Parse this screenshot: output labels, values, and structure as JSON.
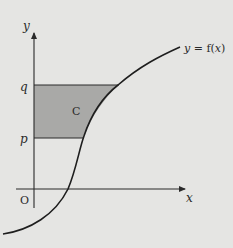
{
  "diagram": {
    "type": "function-graph-area",
    "axes": {
      "x_label": "x",
      "y_label": "y",
      "origin_label": "O"
    },
    "y_levels": {
      "lower_label": "p",
      "upper_label": "q"
    },
    "curve_label": "y = f(x)",
    "region_label": "C",
    "region_description": "Area between the curve and the y-axis, for y from p to q",
    "colors": {
      "background": "#e5e5e3",
      "region_fill": "#a9a9a7",
      "line": "#2a2a2a"
    }
  }
}
